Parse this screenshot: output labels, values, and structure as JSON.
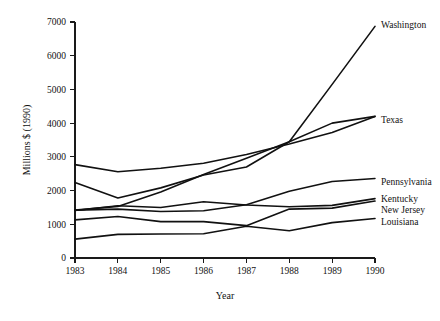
{
  "chart_data": {
    "type": "line",
    "title": "",
    "xlabel": "Year",
    "ylabel": "Millions $ (1990)",
    "x": [
      1983,
      1984,
      1985,
      1986,
      1987,
      1988,
      1989,
      1990
    ],
    "categories": [
      "1983",
      "1984",
      "1985",
      "1986",
      "1987",
      "1988",
      "1989",
      "1990"
    ],
    "xlim": [
      1983,
      1990
    ],
    "ylim": [
      0,
      7000
    ],
    "yticks": [
      0,
      1000,
      2000,
      3000,
      4000,
      5000,
      6000,
      7000
    ],
    "ytick_labels": [
      "0",
      "1000",
      "2000",
      "3000",
      "4000",
      "5000",
      "6000",
      "7000"
    ],
    "grid": false,
    "legend_position": "right-end-of-line",
    "series": [
      {
        "name": "Washington",
        "label": "Washington",
        "values": [
          1420,
          1530,
          1960,
          2480,
          2960,
          3450,
          5150,
          6870
        ]
      },
      {
        "name": "Texas",
        "label": "Texas",
        "values": [
          2240,
          1780,
          2080,
          2460,
          2700,
          3380,
          3720,
          4200
        ]
      },
      {
        "name": "Pennsylvania",
        "label": "Pennsylvania",
        "values": [
          2770,
          2560,
          2660,
          2810,
          3070,
          3500,
          3700,
          4200
        ]
      },
      {
        "name": "Kentucky",
        "label": "Kentucky",
        "values": [
          1410,
          1550,
          1500,
          1670,
          1570,
          1520,
          1560,
          1760
        ]
      },
      {
        "name": "New Jersey",
        "label": "New Jersey",
        "values": [
          1130,
          1230,
          1080,
          1080,
          960,
          1450,
          1480,
          1690
        ]
      },
      {
        "name": "Louisiana",
        "label": "Louisiana",
        "values": [
          560,
          700,
          710,
          720,
          940,
          810,
          1050,
          1170
        ]
      }
    ]
  },
  "series_draw": [
    {
      "key": "washington",
      "label": "Washington",
      "values": [
        1420,
        1530,
        1960,
        2480,
        2960,
        3450,
        5150,
        6870
      ],
      "label_y": 6870
    },
    {
      "key": "pennsylvania",
      "label": "Pennsylvania",
      "values": [
        2770,
        2560,
        2660,
        2810,
        3070,
        3380,
        3720,
        4200
      ],
      "label_y": 4200
    },
    {
      "key": "texas",
      "label": "Texas",
      "values": [
        2240,
        1780,
        2080,
        2460,
        2700,
        3450,
        4000,
        4200
      ],
      "label_y": 4200
    },
    {
      "key": "penn2",
      "label": "Pennsylvania",
      "values": [
        1420,
        1450,
        1380,
        1400,
        1580,
        1980,
        2270,
        2360
      ],
      "label_y": 2360
    },
    {
      "key": "kentucky",
      "label": "Kentucky",
      "values": [
        1410,
        1550,
        1500,
        1670,
        1570,
        1520,
        1560,
        1760
      ],
      "label_y": 1760
    },
    {
      "key": "newjersey",
      "label": "New Jersey",
      "values": [
        1130,
        1230,
        1080,
        1080,
        960,
        1450,
        1480,
        1690
      ],
      "label_y": 1690
    },
    {
      "key": "louisiana",
      "label": "Louisiana",
      "values": [
        560,
        700,
        710,
        720,
        940,
        810,
        1050,
        1170
      ],
      "label_y": 1170
    }
  ],
  "labels": {
    "washington": "Washington",
    "texas": "Texas",
    "pennsylvania": "Pennsylvania",
    "kentucky": "Kentucky",
    "newjersey": "New Jersey",
    "louisiana": "Louisiana",
    "xlabel": "Year",
    "ylabel": "Millions $ (1990)"
  }
}
